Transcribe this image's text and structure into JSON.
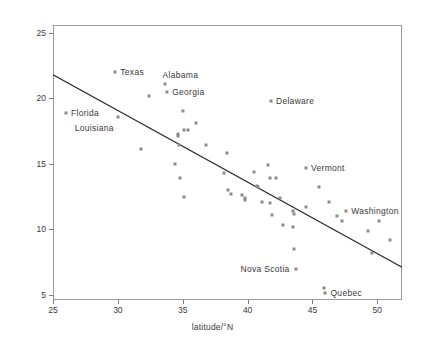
{
  "chart_data": {
    "type": "scatter",
    "title": "",
    "xlabel": "latitude/°N",
    "ylabel": "deaths per million from melanoma",
    "xlim": [
      25,
      51.9
    ],
    "ylim": [
      4.6,
      25.6
    ],
    "xticks": [
      25,
      30,
      35,
      40,
      45,
      50
    ],
    "yticks": [
      5,
      10,
      15,
      20,
      25
    ],
    "grid": false,
    "legend": null,
    "marker_color": "#8c8c8c",
    "line_color": "#2b2b2b",
    "trendline": {
      "label": "least-squares fit",
      "x": [
        25.0,
        51.9
      ],
      "y": [
        21.8,
        7.1
      ]
    },
    "points": [
      {
        "x": 26.0,
        "y": 18.9,
        "label": "Florida",
        "label_pos": "right"
      },
      {
        "x": 29.8,
        "y": 22.0,
        "label": "Texas",
        "label_pos": "right"
      },
      {
        "x": 30.0,
        "y": 18.6,
        "label": "Louisiana",
        "label_pos": "below-left"
      },
      {
        "x": 31.8,
        "y": 16.1,
        "label": null
      },
      {
        "x": 32.4,
        "y": 20.2,
        "label": null
      },
      {
        "x": 33.6,
        "y": 21.1,
        "label": "Alabama",
        "label_pos": "above-right"
      },
      {
        "x": 33.8,
        "y": 20.5,
        "label": "Georgia",
        "label_pos": "right"
      },
      {
        "x": 34.4,
        "y": 15.0,
        "label": null
      },
      {
        "x": 34.6,
        "y": 17.3,
        "label": null
      },
      {
        "x": 34.6,
        "y": 17.1,
        "label": null
      },
      {
        "x": 34.7,
        "y": 16.4,
        "label": null
      },
      {
        "x": 34.8,
        "y": 13.9,
        "label": null
      },
      {
        "x": 35.0,
        "y": 19.0,
        "label": null
      },
      {
        "x": 35.1,
        "y": 17.6,
        "label": null
      },
      {
        "x": 35.1,
        "y": 12.5,
        "label": null
      },
      {
        "x": 35.4,
        "y": 17.6,
        "label": null
      },
      {
        "x": 36.0,
        "y": 18.1,
        "label": null
      },
      {
        "x": 36.8,
        "y": 16.4,
        "label": null
      },
      {
        "x": 38.4,
        "y": 15.8,
        "label": null
      },
      {
        "x": 38.2,
        "y": 14.3,
        "label": null
      },
      {
        "x": 38.5,
        "y": 13.0,
        "label": null
      },
      {
        "x": 38.7,
        "y": 12.7,
        "label": null
      },
      {
        "x": 39.6,
        "y": 12.6,
        "label": null
      },
      {
        "x": 39.8,
        "y": 12.4,
        "label": null
      },
      {
        "x": 39.8,
        "y": 12.2,
        "label": null
      },
      {
        "x": 40.5,
        "y": 14.4,
        "label": null
      },
      {
        "x": 40.7,
        "y": 13.3,
        "label": null
      },
      {
        "x": 40.8,
        "y": 13.2,
        "label": null
      },
      {
        "x": 41.1,
        "y": 12.1,
        "label": null
      },
      {
        "x": 41.6,
        "y": 14.9,
        "label": null
      },
      {
        "x": 41.7,
        "y": 13.9,
        "label": null
      },
      {
        "x": 41.7,
        "y": 12.0,
        "label": null
      },
      {
        "x": 41.8,
        "y": 19.8,
        "label": "Delaware",
        "label_pos": "right"
      },
      {
        "x": 41.9,
        "y": 11.1,
        "label": null
      },
      {
        "x": 42.2,
        "y": 13.9,
        "label": null
      },
      {
        "x": 42.5,
        "y": 12.4,
        "label": null
      },
      {
        "x": 42.7,
        "y": 10.3,
        "label": null
      },
      {
        "x": 43.5,
        "y": 11.4,
        "label": null
      },
      {
        "x": 43.6,
        "y": 11.2,
        "label": null
      },
      {
        "x": 43.5,
        "y": 10.2,
        "label": null
      },
      {
        "x": 43.6,
        "y": 8.5,
        "label": null
      },
      {
        "x": 43.7,
        "y": 7.0,
        "label": "Nova Scotia",
        "label_pos": "left"
      },
      {
        "x": 44.5,
        "y": 14.7,
        "label": "Vermont",
        "label_pos": "right"
      },
      {
        "x": 44.5,
        "y": 11.7,
        "label": null
      },
      {
        "x": 45.5,
        "y": 13.2,
        "label": null
      },
      {
        "x": 45.9,
        "y": 5.5,
        "label": null
      },
      {
        "x": 46.0,
        "y": 5.1,
        "label": "Quebec",
        "label_pos": "right"
      },
      {
        "x": 46.3,
        "y": 12.1,
        "label": null
      },
      {
        "x": 46.9,
        "y": 11.0,
        "label": null
      },
      {
        "x": 47.3,
        "y": 10.6,
        "label": null
      },
      {
        "x": 47.6,
        "y": 11.4,
        "label": "Washington",
        "label_pos": "right"
      },
      {
        "x": 49.3,
        "y": 9.9,
        "label": null
      },
      {
        "x": 50.1,
        "y": 10.6,
        "label": null
      },
      {
        "x": 49.6,
        "y": 8.2,
        "label": null
      },
      {
        "x": 51.0,
        "y": 9.2,
        "label": null
      }
    ]
  }
}
